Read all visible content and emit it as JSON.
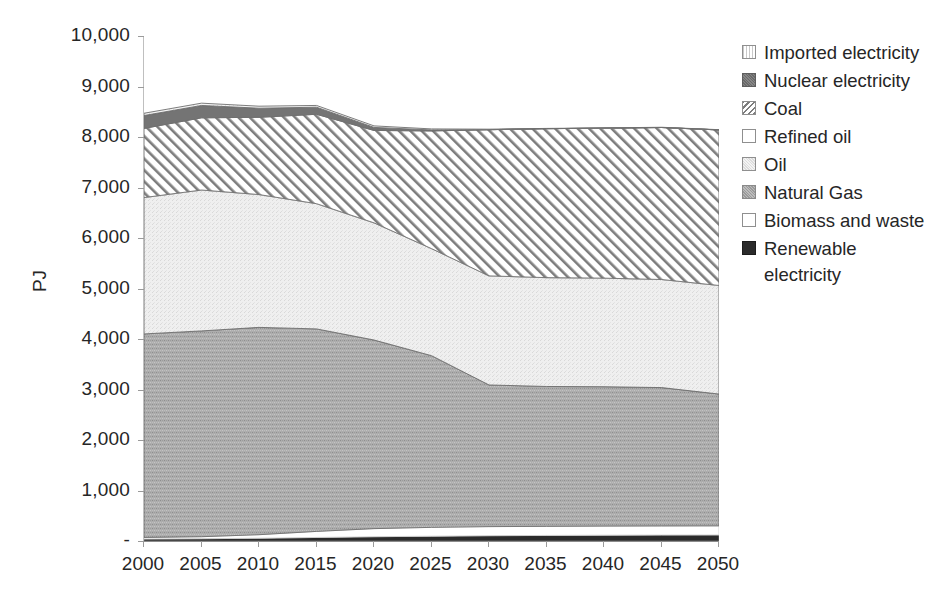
{
  "chart_data": {
    "type": "area",
    "stacked": true,
    "title": "",
    "xlabel": "",
    "ylabel": "PJ",
    "categories": [
      2000,
      2005,
      2010,
      2015,
      2020,
      2025,
      2030,
      2035,
      2040,
      2045,
      2050
    ],
    "xtick_labels": [
      "2000",
      "2005",
      "2010",
      "2015",
      "2020",
      "2025",
      "2030",
      "2035",
      "2040",
      "2045",
      "2050"
    ],
    "ylim": [
      0,
      10000
    ],
    "ytick_values": [
      0,
      1000,
      2000,
      3000,
      4000,
      5000,
      6000,
      7000,
      8000,
      9000,
      10000
    ],
    "ytick_labels": [
      "-",
      "1,000",
      "2,000",
      "3,000",
      "4,000",
      "5,000",
      "6,000",
      "7,000",
      "8,000",
      "9,000",
      "10,000"
    ],
    "grid": false,
    "legend_position": "right",
    "stack_order_bottom_to_top": [
      "Renewable electricity",
      "Biomass and waste",
      "Natural Gas",
      "Oil",
      "Refined oil",
      "Coal",
      "Nuclear electricity",
      "Imported electricity"
    ],
    "series": [
      {
        "name": "Renewable electricity",
        "fill": "#2b2b2b",
        "pattern": "solid",
        "values": [
          40,
          45,
          55,
          70,
          85,
          95,
          105,
          110,
          115,
          118,
          120
        ]
      },
      {
        "name": "Biomass and waste",
        "fill": "#ffffff",
        "pattern": "solid",
        "values": [
          30,
          40,
          70,
          120,
          160,
          175,
          180,
          180,
          180,
          180,
          180
        ]
      },
      {
        "name": "Natural Gas",
        "fill": "#a8a8a8",
        "pattern": "speckle-medium",
        "values": [
          4030,
          4075,
          4105,
          4010,
          3735,
          3400,
          2805,
          2770,
          2760,
          2740,
          2610
        ]
      },
      {
        "name": "Oil",
        "fill": "#ededed",
        "pattern": "speckle-light",
        "values": [
          2700,
          2790,
          2630,
          2480,
          2320,
          2120,
          2160,
          2155,
          2150,
          2140,
          2150
        ]
      },
      {
        "name": "Refined oil",
        "fill": "#ffffff",
        "pattern": "solid",
        "values": [
          0,
          0,
          0,
          0,
          0,
          0,
          0,
          0,
          0,
          0,
          0
        ]
      },
      {
        "name": "Coal",
        "fill": "#ffffff",
        "pattern": "diagonal-hatch",
        "values": [
          1370,
          1430,
          1530,
          1770,
          1830,
          2330,
          2895,
          2950,
          2970,
          3010,
          3080
        ]
      },
      {
        "name": "Nuclear electricity",
        "fill": "#747474",
        "pattern": "solid",
        "values": [
          255,
          245,
          180,
          140,
          60,
          20,
          0,
          0,
          0,
          0,
          0
        ]
      },
      {
        "name": "Imported electricity",
        "fill": "#f2f2f2",
        "pattern": "solid",
        "values": [
          45,
          45,
          40,
          35,
          30,
          20,
          10,
          5,
          5,
          5,
          5
        ]
      }
    ],
    "totals": [
      8470,
      8670,
      8610,
      8625,
      8220,
      8160,
      8155,
      8170,
      8180,
      8193,
      8145
    ]
  },
  "legend": {
    "items": [
      {
        "label": "Imported electricity",
        "swatch": "sp-imported"
      },
      {
        "label": "Nuclear electricity",
        "swatch": "sp-nuclear"
      },
      {
        "label": "Coal",
        "swatch": "sp-coal"
      },
      {
        "label": "Refined oil",
        "swatch": "sp-refined"
      },
      {
        "label": "Oil",
        "swatch": "sp-oil"
      },
      {
        "label": "Natural Gas",
        "swatch": "sp-gas"
      },
      {
        "label": "Biomass and waste",
        "swatch": "sp-biomass"
      },
      {
        "label": "Renewable electricity",
        "swatch": "sp-renewable"
      }
    ]
  }
}
